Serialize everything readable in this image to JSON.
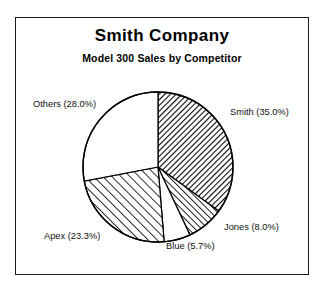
{
  "frame": {
    "border_color": "#1a1a1a",
    "background": "#ffffff"
  },
  "header": {
    "title": "Smith Company",
    "subtitle": "Model 300 Sales by Competitor"
  },
  "labels": {
    "smith": "Smith (35.0%)",
    "jones": "Jones (8.0%)",
    "blue": "Blue (5.7%)",
    "apex": "Apex (23.3%)",
    "others": "Others (28.0%)"
  },
  "chart_data": {
    "type": "pie",
    "title": "Smith Company",
    "subtitle": "Model 300 Sales by Competitor",
    "xlabel": "",
    "ylabel": "",
    "categories": [
      "Smith",
      "Jones",
      "Blue",
      "Apex",
      "Others"
    ],
    "values": [
      35.0,
      8.0,
      5.7,
      23.3,
      28.0
    ],
    "value_unit": "percent",
    "total": 100.0,
    "start_angle_deg": 0,
    "direction": "clockwise",
    "legend": "none",
    "labels_inline": true,
    "grid": false,
    "slices": [
      {
        "name": "Smith",
        "label": "Smith (35.0%)",
        "percent": 35.0,
        "fill": "hatch-dense-backslash",
        "fill_color": "#ffffff",
        "line_color": "#000000",
        "start_deg": 0.0,
        "end_deg": 126.0,
        "label_position": "right"
      },
      {
        "name": "Jones",
        "label": "Jones (8.0%)",
        "percent": 8.0,
        "fill": "hatch-medium-slash",
        "fill_color": "#ffffff",
        "line_color": "#000000",
        "start_deg": 126.0,
        "end_deg": 154.8,
        "label_position": "bottom-right"
      },
      {
        "name": "Blue",
        "label": "Blue (5.7%)",
        "percent": 5.7,
        "fill": "solid-white",
        "fill_color": "#ffffff",
        "line_color": "#000000",
        "start_deg": 154.8,
        "end_deg": 175.3,
        "label_position": "bottom"
      },
      {
        "name": "Apex",
        "label": "Apex (23.3%)",
        "percent": 23.3,
        "fill": "hatch-wide-slash",
        "fill_color": "#ffffff",
        "line_color": "#000000",
        "start_deg": 175.3,
        "end_deg": 259.2,
        "label_position": "bottom-left"
      },
      {
        "name": "Others",
        "label": "Others (28.0%)",
        "percent": 28.0,
        "fill": "solid-white",
        "fill_color": "#ffffff",
        "line_color": "#000000",
        "start_deg": 259.2,
        "end_deg": 360.0,
        "label_position": "top-left"
      }
    ],
    "geometry": {
      "center_x": 158,
      "center_y": 167,
      "radius": 75
    }
  }
}
